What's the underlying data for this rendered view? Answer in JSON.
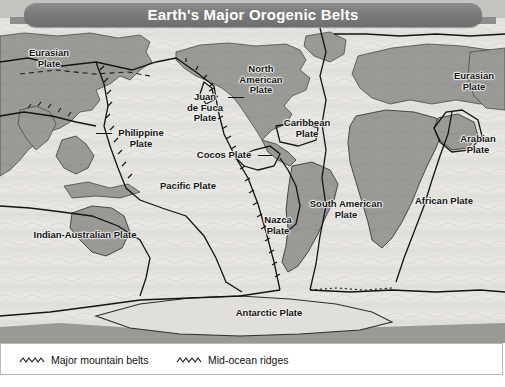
{
  "figure": {
    "title": "Earth's Major Orogenic Belts",
    "background_color": "#ffffff",
    "banner_color": "#7c7c7c",
    "title_color": "#ffffff"
  },
  "map": {
    "ocean_color": "#eceae6",
    "land_color": "#9d9d98",
    "border_color": "#111111",
    "plate_labels": [
      {
        "name": "eurasian-plate-asia",
        "text": "Eurasian\nPlate",
        "x": 21,
        "y": 48
      },
      {
        "name": "philippine-plate",
        "text": "Philippine\nPlate",
        "x": 110,
        "y": 128
      },
      {
        "name": "indian-australian-plate",
        "text": "Indian-Australian Plate",
        "x": 22,
        "y": 230
      },
      {
        "name": "pacific-plate",
        "text": "Pacific Plate",
        "x": 150,
        "y": 181
      },
      {
        "name": "juan-de-fuca-plate",
        "text": "Juan\nde Fuca\nPlate",
        "x": 181,
        "y": 92
      },
      {
        "name": "cocos-plate",
        "text": "Cocos Plate",
        "x": 190,
        "y": 150
      },
      {
        "name": "north-american-plate",
        "text": "North\nAmerican\nPlate",
        "x": 232,
        "y": 64
      },
      {
        "name": "caribbean-plate",
        "text": "Caribbean\nPlate",
        "x": 278,
        "y": 118
      },
      {
        "name": "nazca-plate",
        "text": "Nazca\nPlate",
        "x": 258,
        "y": 215
      },
      {
        "name": "south-american-plate",
        "text": "South American\nPlate",
        "x": 305,
        "y": 199
      },
      {
        "name": "african-plate",
        "text": "African Plate",
        "x": 408,
        "y": 196
      },
      {
        "name": "arabian-plate",
        "text": "Arabian\nPlate",
        "x": 455,
        "y": 134
      },
      {
        "name": "eurasian-plate-europe",
        "text": "Eurasian\nPlate",
        "x": 448,
        "y": 71
      },
      {
        "name": "antarctic-plate",
        "text": "Antarctic Plate",
        "x": 228,
        "y": 308
      }
    ]
  },
  "legend": {
    "items": [
      {
        "name": "major-mountain-belts",
        "label": "Major mountain belts",
        "symbol": "zigzag-line"
      },
      {
        "name": "mid-ocean-ridges",
        "label": "Mid-ocean ridges",
        "symbol": "zigzag-line"
      }
    ]
  }
}
